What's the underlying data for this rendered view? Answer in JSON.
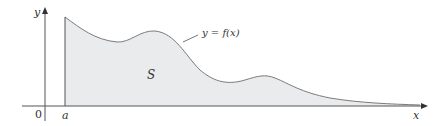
{
  "figure": {
    "region_label": "S",
    "curve_label": "y = f(x)",
    "x_axis_label": "x",
    "y_axis_label": "y",
    "origin_label": "0",
    "left_bound_label": "a",
    "colors": {
      "fill": "#e9ebec",
      "curve": "#7b7b7b",
      "axis": "#555555"
    }
  }
}
